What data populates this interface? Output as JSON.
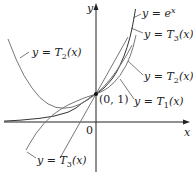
{
  "figure": {
    "axes": {
      "x_label": "x",
      "y_label": "y",
      "origin_label": "0"
    },
    "point": {
      "label": "(0, 1)",
      "x": 0,
      "y": 1
    },
    "labels": {
      "exp": {
        "prefix": "y = ",
        "main": "e",
        "sup": "x"
      },
      "t3_right": {
        "prefix": "y = ",
        "main": "T",
        "sub": "3",
        "suffix": "(x)"
      },
      "t2_right": {
        "prefix": "y = ",
        "main": "T",
        "sub": "2",
        "suffix": "(x)"
      },
      "t1_right": {
        "prefix": "y = ",
        "main": "T",
        "sub": "1",
        "suffix": "(x)"
      },
      "t2_left": {
        "prefix": "y = ",
        "main": "T",
        "sub": "2",
        "suffix": "(x)"
      },
      "t3_bottom": {
        "prefix": "y = ",
        "main": "T",
        "sub": "3",
        "suffix": "(x)"
      }
    },
    "curves": [
      {
        "name": "e^x",
        "expression": "e^x"
      },
      {
        "name": "T1",
        "expression": "1 + x"
      },
      {
        "name": "T2",
        "expression": "1 + x + x^2/2"
      },
      {
        "name": "T3",
        "expression": "1 + x + x^2/2 + x^3/6"
      }
    ]
  }
}
